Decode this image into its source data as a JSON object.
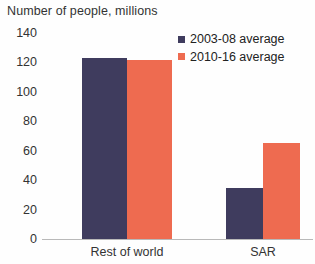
{
  "chart_data": {
    "type": "bar",
    "title": "Number of people, millions",
    "xlabel": "",
    "ylabel": "",
    "categories": [
      "Rest of world",
      "SAR"
    ],
    "series": [
      {
        "name": "2003-08 average",
        "color": "#3f3c5e",
        "values": [
          123,
          35
        ]
      },
      {
        "name": "2010-16 average",
        "color": "#ee6b50",
        "values": [
          122,
          65
        ]
      }
    ],
    "ylim": [
      0,
      140
    ],
    "yticks": [
      0,
      20,
      40,
      60,
      80,
      100,
      120,
      140
    ],
    "ytick_labels": [
      "0",
      "20",
      "40",
      "60",
      "80",
      "100",
      "120",
      "140"
    ],
    "grid": false,
    "legend_position": "top-right",
    "axis_color": "#b9b9b9",
    "background_color": "#fefefe"
  },
  "legend": {
    "items": [
      {
        "label": "2003-08 average"
      },
      {
        "label": "2010-16 average"
      }
    ]
  }
}
